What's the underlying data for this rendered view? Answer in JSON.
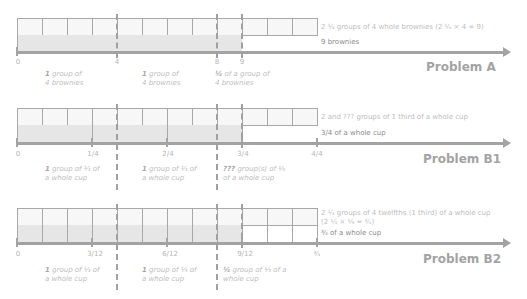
{
  "problems": [
    {
      "id": "A",
      "title": "Problem A",
      "top_text": "2 ¼ groups of 4 whole brownies (2 ¼ × 4 = 9)",
      "top_text_line2": "",
      "bottom_text": "9 brownies",
      "ticks": [
        "0",
        "4",
        "8",
        "9"
      ],
      "notes": [
        {
          "bold": "1",
          "text": " group of",
          "line2": "4 brownies"
        },
        {
          "bold": "1",
          "text": " group of",
          "line2": "4 brownies"
        },
        {
          "bold": "¼",
          "text": " of a group of",
          "line2": "4 brownies"
        }
      ]
    },
    {
      "id": "B1",
      "title": "Problem B1",
      "top_text": "2 and ??? groups of 1 third of a whole cup",
      "top_text_line2": "",
      "bottom_text": "3/4 of a whole cup",
      "ticks": [
        "0",
        "1/4",
        "2/4",
        "3/4",
        "4/4"
      ],
      "notes": [
        {
          "bold": "1",
          "text": " group of ⅓ of",
          "line2": "a whole cup"
        },
        {
          "bold": "1",
          "text": " group of ⅓ of",
          "line2": "a whole cup"
        },
        {
          "bold": "???",
          "text": " group(s) of ⅓",
          "line2": "of a whole cup"
        }
      ]
    },
    {
      "id": "B2",
      "title": "Problem B2",
      "top_text": "2 ¼ groups of 4 twelfths (1 third) of a whole cup",
      "top_text_line2": "(2 ¼ × ⅓ = ¾)",
      "bottom_text": "¾ of a whole cup",
      "ticks": [
        "0",
        "3/12",
        "6/12",
        "9/12",
        "¾"
      ],
      "notes": [
        {
          "bold": "1",
          "text": " group of ⅓ of",
          "line2": "a whole cup"
        },
        {
          "bold": "1",
          "text": " group of ⅓ of",
          "line2": "a whole cup"
        },
        {
          "bold": "¼",
          "text": " group of ⅓ of a",
          "line2": "whole cup"
        }
      ]
    }
  ],
  "colors": {
    "axis": "#a3a3a3",
    "shade": "#e6e6e6",
    "cell_border": "#a8a8a8",
    "text_light": "#bdbdbd"
  }
}
